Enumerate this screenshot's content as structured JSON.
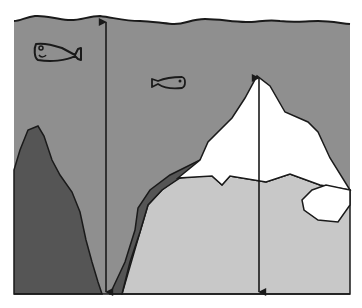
{
  "diagram": {
    "title": "Iceberg and ocean trench depth illustration",
    "colors": {
      "background": "#ffffff",
      "water": "#8f8f8f",
      "dark_rock": "#555555",
      "seafloor_light": "#c8c8c8",
      "ice": "#ffffff",
      "outline": "#1a1a1a"
    },
    "elements": [
      {
        "id": "water-surface",
        "label": "Wavy water surface line"
      },
      {
        "id": "fish-large",
        "label": "Large fish outline"
      },
      {
        "id": "fish-small",
        "label": "Small fish outline"
      },
      {
        "id": "rock-left",
        "label": "Dark rock pillar (left)"
      },
      {
        "id": "trench-wall",
        "label": "Dark trench wall"
      },
      {
        "id": "iceberg",
        "label": "White iceberg peak"
      },
      {
        "id": "ice-chunk",
        "label": "Small ice chunk"
      },
      {
        "id": "depth-arrow-left",
        "label": "Double-headed arrow: surface to trench bottom"
      },
      {
        "id": "height-arrow-right",
        "label": "Double-headed arrow: iceberg peak to seafloor"
      }
    ]
  }
}
